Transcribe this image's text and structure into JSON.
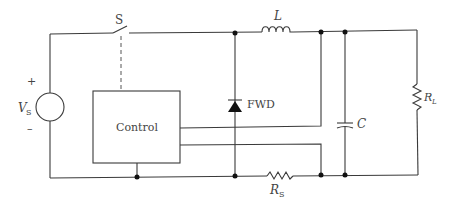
{
  "labels": {
    "switch": "S",
    "inductor": "L",
    "diode": "FWD",
    "capacitor": "C",
    "load_resistor_main": "R",
    "load_resistor_sub": "L",
    "sense_resistor_main": "R",
    "sense_resistor_sub": "S",
    "source_main": "V",
    "source_sub": "S",
    "source_plus": "+",
    "source_minus": "–",
    "control_block": "Control"
  },
  "components": [
    {
      "id": "VS",
      "type": "dc-voltage-source"
    },
    {
      "id": "S",
      "type": "switch",
      "controlled_by": "Control"
    },
    {
      "id": "L",
      "type": "inductor"
    },
    {
      "id": "FWD",
      "type": "freewheeling-diode"
    },
    {
      "id": "C",
      "type": "capacitor"
    },
    {
      "id": "RL",
      "type": "load-resistor"
    },
    {
      "id": "RS",
      "type": "sense-resistor"
    },
    {
      "id": "Control",
      "type": "control-block"
    }
  ],
  "colors": {
    "wire": "#3a3a3a",
    "text": "#444444",
    "background": "#ffffff"
  }
}
